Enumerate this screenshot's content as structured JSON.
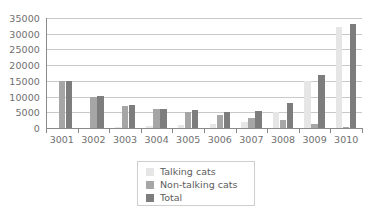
{
  "chart_data": {
    "type": "bar",
    "title": "",
    "subtitle": "",
    "xlabel": "",
    "ylabel": "",
    "categories": [
      "3001",
      "3002",
      "3003",
      "3004",
      "3005",
      "3006",
      "3007",
      "3008",
      "3009",
      "3010"
    ],
    "series": [
      {
        "name": "Talking cats",
        "color": "#e6e6e6",
        "values": [
          0,
          0,
          300,
          500,
          900,
          1200,
          1800,
          5000,
          15000,
          32000
        ]
      },
      {
        "name": "Non-talking cats",
        "color": "#a6a6a6",
        "values": [
          15000,
          10000,
          7000,
          6000,
          5200,
          4000,
          3300,
          2500,
          1400,
          400
        ]
      },
      {
        "name": "Total",
        "color": "#7d7d7d",
        "values": [
          15000,
          10200,
          7400,
          6200,
          5700,
          5000,
          5500,
          8000,
          17000,
          33000
        ]
      }
    ],
    "ylim": [
      0,
      35000
    ],
    "ytick_values": [
      0,
      5000,
      10000,
      15000,
      20000,
      25000,
      30000,
      35000
    ],
    "ytick_labels": [
      "0",
      "5000",
      "10000",
      "15000",
      "20000",
      "25000",
      "30000",
      "35000"
    ],
    "grid": true,
    "grid_axis": "y",
    "legend_position": "bottom-center",
    "legend": [
      "Talking cats",
      "Non-talking cats",
      "Total"
    ],
    "annotations": []
  },
  "colors": {
    "background": "#ffffff",
    "axis": "#8a8a8a",
    "gridline": "#c9c9c9",
    "tick_text": "#6f6f6f",
    "legend_text": "#5d5d5d",
    "legend_border": "#cfcfcf"
  }
}
